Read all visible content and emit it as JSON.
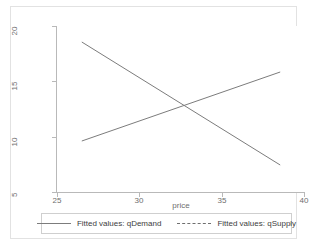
{
  "chart_data": {
    "type": "line",
    "title": "",
    "xlabel": "price",
    "ylabel": "",
    "xlim": [
      25,
      40
    ],
    "ylim": [
      4.0,
      20.6
    ],
    "xticks": [
      25,
      30,
      35,
      40
    ],
    "yticks": [
      5,
      10,
      15,
      20
    ],
    "xtick_labels": [
      "25",
      "30",
      "35",
      "40"
    ],
    "ytick_labels": [
      "5",
      "10",
      "15",
      "20"
    ],
    "grid": false,
    "legend_position": "bottom",
    "line_color": "#7c7c7c",
    "axis_color": "#b9b9b9",
    "background": "#ffffff",
    "series": [
      {
        "name": "Fitted values: qDemand",
        "style": "solid",
        "color": "#7c7c7c",
        "x": [
          26.5,
          38.5
        ],
        "y": [
          19.0,
          6.7
        ]
      },
      {
        "name": "Fitted values: qSupply",
        "style": "dashed",
        "color": "#7c7c7c",
        "x": [
          26.5,
          38.5
        ],
        "y": [
          9.1,
          16.0
        ]
      }
    ],
    "annotations": {
      "equilibrium_x": 32.8,
      "equilibrium_y": 12.6
    }
  },
  "legend": {
    "items": [
      {
        "label": "Fitted values: qDemand",
        "style": "solid"
      },
      {
        "label": "Fitted values: qSupply",
        "style": "dashed"
      }
    ]
  }
}
